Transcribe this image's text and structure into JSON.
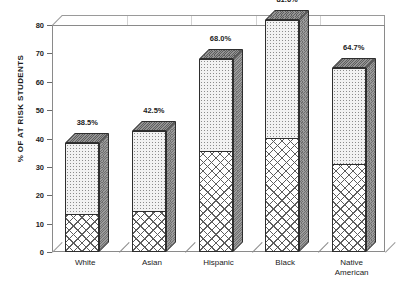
{
  "chart_data": {
    "type": "bar",
    "subtype": "stacked-3d-column",
    "title": "",
    "xlabel": "",
    "ylabel": "% OF AT RISK STUDENTS",
    "ylim": [
      0,
      80
    ],
    "ytick_labels": [
      "0",
      "10",
      "20",
      "30",
      "40",
      "50",
      "60",
      "70",
      "80"
    ],
    "ytick_values": [
      0,
      10,
      20,
      30,
      40,
      50,
      60,
      70,
      80
    ],
    "grid": true,
    "legend": "none",
    "categories": [
      "White",
      "Asian",
      "Hispanic",
      "Black",
      "Native American"
    ],
    "category_lines": [
      [
        "White"
      ],
      [
        "Asian"
      ],
      [
        "Hispanic"
      ],
      [
        "Black"
      ],
      [
        "Native",
        "American"
      ]
    ],
    "values": [
      38.5,
      42.5,
      68.0,
      81.6,
      64.7
    ],
    "data_labels": [
      "38.5%",
      "42.5%",
      "68.0%",
      "81.6%",
      "64.7%"
    ],
    "series": [
      {
        "name": "lower-segment",
        "pattern": "cross-hatch",
        "values": [
          13.5,
          14.5,
          35.5,
          40.0,
          31.0
        ]
      },
      {
        "name": "upper-segment",
        "pattern": "dotted",
        "values": [
          25.0,
          28.0,
          32.5,
          41.6,
          33.7
        ]
      }
    ],
    "colors": {
      "upper_fill": "#f2f2f2",
      "lower_fill": "#ffffff",
      "side_face": "#8e8e8e",
      "top_face": "#787878",
      "outline": "#2e2e2e",
      "gridline": "#c9c9c9",
      "axis": "#8a8a8a",
      "text": "#1b1b1b"
    }
  }
}
